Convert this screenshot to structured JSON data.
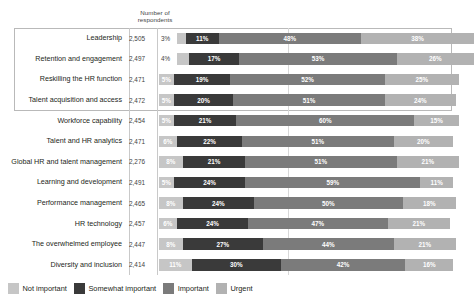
{
  "header": {
    "respondents_label": "Number of\nrespondents",
    "respondents_line1": "Number of",
    "respondents_line2": "respondents"
  },
  "legend": {
    "items": [
      {
        "label": "Not important",
        "color": "#c6c6c6"
      },
      {
        "label": "Somewhat important",
        "color": "#3a3a3a"
      },
      {
        "label": "Important",
        "color": "#7b7b7b"
      },
      {
        "label": "Urgent",
        "color": "#b2b2b2"
      }
    ]
  },
  "chart_data": {
    "type": "bar",
    "orientation": "horizontal",
    "stacked": true,
    "stacked_percent": true,
    "title": "",
    "subtitle": "",
    "xlabel": "",
    "ylabel": "",
    "xlim": [
      0,
      100
    ],
    "grid": false,
    "legend_position": "bottom-left",
    "series": [
      {
        "name": "Not important",
        "color": "#c6c6c6",
        "values": [
          3,
          4,
          5,
          5,
          5,
          6,
          8,
          5,
          8,
          6,
          8,
          11
        ]
      },
      {
        "name": "Somewhat important",
        "color": "#3a3a3a",
        "values": [
          11,
          17,
          19,
          20,
          21,
          22,
          21,
          24,
          24,
          24,
          27,
          30
        ]
      },
      {
        "name": "Important",
        "color": "#7b7b7b",
        "values": [
          48,
          53,
          52,
          51,
          60,
          51,
          51,
          59,
          50,
          47,
          44,
          42
        ]
      },
      {
        "name": "Urgent",
        "color": "#b2b2b2",
        "values": [
          38,
          26,
          25,
          24,
          15,
          20,
          21,
          11,
          18,
          21,
          21,
          16
        ]
      }
    ],
    "categories": [
      "Leadership",
      "Retention and engagement",
      "Reskilling the HR function",
      "Talent acquisition and access",
      "Workforce capability",
      "Talent and HR analytics",
      "Global HR and talent management",
      "Learning and development",
      "Performance management",
      "HR technology",
      "The overwhelmed employee",
      "Diversity and inclusion"
    ],
    "respondents": [
      "2,505",
      "2,497",
      "2,471",
      "2,472",
      "2,454",
      "2,471",
      "2,276",
      "2,491",
      "2,465",
      "2,457",
      "2,447",
      "2,414"
    ]
  },
  "rows": [
    {
      "label": "Leadership",
      "respondents": "2,505",
      "not_important": "3%",
      "somewhat_important": "11%",
      "important": "48%",
      "urgent": "38%",
      "not_important_outside": true
    },
    {
      "label": "Retention and engagement",
      "respondents": "2,497",
      "not_important": "4%",
      "somewhat_important": "17%",
      "important": "53%",
      "urgent": "26%",
      "not_important_outside": true
    },
    {
      "label": "Reskilling the HR function",
      "respondents": "2,471",
      "not_important": "5%",
      "somewhat_important": "19%",
      "important": "52%",
      "urgent": "25%",
      "not_important_outside": false
    },
    {
      "label": "Talent acquisition and access",
      "respondents": "2,472",
      "not_important": "5%",
      "somewhat_important": "20%",
      "important": "51%",
      "urgent": "24%",
      "not_important_outside": false
    },
    {
      "label": "Workforce capability",
      "respondents": "2,454",
      "not_important": "5%",
      "somewhat_important": "21%",
      "important": "60%",
      "urgent": "15%",
      "not_important_outside": false
    },
    {
      "label": "Talent and HR analytics",
      "respondents": "2,471",
      "not_important": "6%",
      "somewhat_important": "22%",
      "important": "51%",
      "urgent": "20%",
      "not_important_outside": false
    },
    {
      "label": "Global HR and talent management",
      "respondents": "2,276",
      "not_important": "8%",
      "somewhat_important": "21%",
      "important": "51%",
      "urgent": "21%",
      "not_important_outside": false
    },
    {
      "label": "Learning and development",
      "respondents": "2,491",
      "not_important": "5%",
      "somewhat_important": "24%",
      "important": "59%",
      "urgent": "11%",
      "not_important_outside": false
    },
    {
      "label": "Performance management",
      "respondents": "2,465",
      "not_important": "8%",
      "somewhat_important": "24%",
      "important": "50%",
      "urgent": "18%",
      "not_important_outside": false
    },
    {
      "label": "HR technology",
      "respondents": "2,457",
      "not_important": "6%",
      "somewhat_important": "24%",
      "important": "47%",
      "urgent": "21%",
      "not_important_outside": false
    },
    {
      "label": "The overwhelmed employee",
      "respondents": "2,447",
      "not_important": "8%",
      "somewhat_important": "27%",
      "important": "44%",
      "urgent": "21%",
      "not_important_outside": false
    },
    {
      "label": "Diversity and inclusion",
      "respondents": "2,414",
      "not_important": "11%",
      "somewhat_important": "30%",
      "important": "42%",
      "urgent": "16%",
      "not_important_outside": false
    }
  ]
}
